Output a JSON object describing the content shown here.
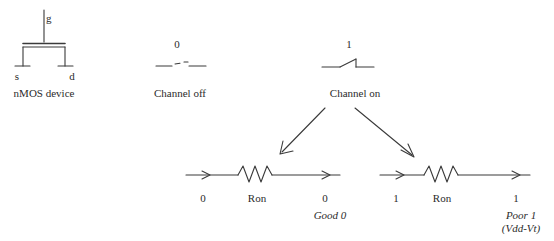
{
  "diagram": {
    "stroke_color": "#3a3a3a",
    "text_color": "#2b2b2b",
    "background": "#ffffff"
  },
  "device": {
    "caption": "nMOS device",
    "terminals": {
      "gate": "g",
      "source": "s",
      "drain": "d"
    },
    "symbol_name": "nmos-transistor-symbol"
  },
  "switch_states": [
    {
      "id": "channel-off",
      "gate_value": "0",
      "caption": "Channel off",
      "symbol_name": "open-switch-icon"
    },
    {
      "id": "channel-on",
      "gate_value": "1",
      "caption": "Channel on",
      "symbol_name": "closed-switch-icon"
    }
  ],
  "branches": [
    {
      "id": "pass-zero",
      "input_label": "0",
      "resistor_label": "Ron",
      "output_label": "0",
      "quality_label": "Good 0",
      "note_label": ""
    },
    {
      "id": "pass-one",
      "input_label": "1",
      "resistor_label": "Ron",
      "output_label": "1",
      "quality_label": "Poor 1",
      "note_label": "(Vdd-Vt)"
    }
  ],
  "arrows": [
    {
      "id": "arrow-to-pass-zero",
      "name": "branch-arrow-left"
    },
    {
      "id": "arrow-to-pass-one",
      "name": "branch-arrow-right"
    }
  ]
}
